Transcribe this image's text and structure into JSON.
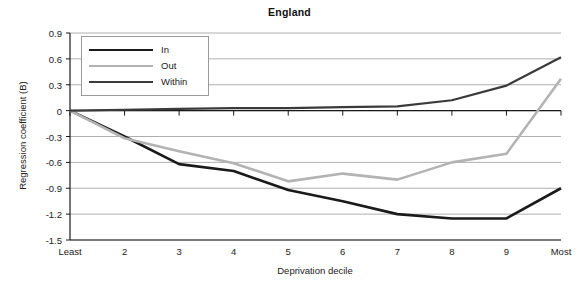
{
  "chart_data": {
    "type": "line",
    "title": "England",
    "xlabel": "Deprivation decile",
    "ylabel": "Regression coefficient (B)",
    "categories": [
      "Least",
      "2",
      "3",
      "4",
      "5",
      "6",
      "7",
      "8",
      "9",
      "Most"
    ],
    "ylim": [
      -1.5,
      0.9
    ],
    "yticks": [
      0.9,
      0.6,
      0.3,
      0,
      -0.3,
      -0.6,
      -0.9,
      -1.2,
      -1.5
    ],
    "ytick_labels": [
      "0.9",
      "0.6",
      "0.3",
      "0",
      "-0.3",
      "-0.6",
      "-0.9",
      "-1.2",
      "-1.5"
    ],
    "grid": true,
    "legend_position": "top-left",
    "series": [
      {
        "name": "In",
        "color": "#1a1a1a",
        "width": 2.6,
        "values": [
          0.0,
          -0.3,
          -0.62,
          -0.7,
          -0.92,
          -1.05,
          -1.2,
          -1.25,
          -1.25,
          -0.9
        ]
      },
      {
        "name": "Out",
        "color": "#b3b3b3",
        "width": 2.6,
        "values": [
          0.0,
          -0.32,
          -0.47,
          -0.61,
          -0.82,
          -0.73,
          -0.8,
          -0.6,
          -0.5,
          0.37
        ]
      },
      {
        "name": "Within",
        "color": "#3a3a3a",
        "width": 2.2,
        "values": [
          0.0,
          0.01,
          0.02,
          0.03,
          0.03,
          0.04,
          0.05,
          0.12,
          0.29,
          0.62
        ]
      }
    ]
  },
  "legend": {
    "items": [
      {
        "label": "In"
      },
      {
        "label": "Out"
      },
      {
        "label": "Within"
      }
    ]
  },
  "colors": {
    "in": "#1a1a1a",
    "out": "#b3b3b3",
    "within": "#3a3a3a",
    "grid": "#9a9a9a",
    "axis": "#1a1a1a",
    "background": "#ffffff"
  }
}
